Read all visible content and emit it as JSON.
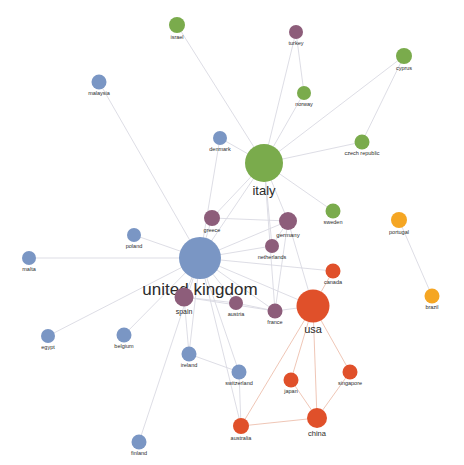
{
  "figure": {
    "type": "network-graph",
    "title": "",
    "watermark": "",
    "width": 464,
    "height": 465,
    "background": "#ffffff"
  },
  "palette": {
    "blue": "#7a96c4",
    "green": "#7aab4c",
    "purple": "#8d5d7a",
    "red": "#e0502a",
    "amber": "#f5a623",
    "edge": "#d9d9e2",
    "edge_warm": "#edbfae",
    "label": "#2b2b2b"
  },
  "clusters": [
    {
      "id": "blue",
      "color": "#7a96c4",
      "label": "blue-cluster"
    },
    {
      "id": "green",
      "color": "#7aab4c",
      "label": "green-cluster"
    },
    {
      "id": "purple",
      "color": "#8d5d7a",
      "label": "purple-cluster"
    },
    {
      "id": "red",
      "color": "#e0502a",
      "label": "red-cluster"
    },
    {
      "id": "amber",
      "color": "#f5a623",
      "label": "amber-cluster"
    }
  ],
  "chart_data": {
    "type": "network",
    "title": "",
    "xlabel": "",
    "ylabel": "",
    "nodes": [
      {
        "id": "israel",
        "label": "israel",
        "x": 177,
        "y": 25,
        "r": 8,
        "cluster": "green",
        "font": 5.5
      },
      {
        "id": "turkey",
        "label": "turkey",
        "x": 296,
        "y": 32,
        "r": 7,
        "cluster": "purple",
        "font": 5.5
      },
      {
        "id": "cyprus",
        "label": "cyprus",
        "x": 404,
        "y": 56,
        "r": 8,
        "cluster": "green",
        "font": 5.5
      },
      {
        "id": "malaysia",
        "label": "malaysia",
        "x": 99,
        "y": 82,
        "r": 7.5,
        "cluster": "blue",
        "font": 5.5
      },
      {
        "id": "norway",
        "label": "norway",
        "x": 304,
        "y": 93,
        "r": 7,
        "cluster": "green",
        "font": 5.5
      },
      {
        "id": "denmark",
        "label": "denmark",
        "x": 220,
        "y": 138,
        "r": 7,
        "cluster": "blue",
        "font": 5.5
      },
      {
        "id": "czech republic",
        "label": "czech republic",
        "x": 362,
        "y": 142,
        "r": 7.5,
        "cluster": "green",
        "font": 5.5
      },
      {
        "id": "italy",
        "label": "italy",
        "x": 264,
        "y": 163,
        "r": 19,
        "cluster": "green",
        "font": 13
      },
      {
        "id": "sweden",
        "label": "sweden",
        "x": 333,
        "y": 211,
        "r": 7.5,
        "cluster": "green",
        "font": 5.5
      },
      {
        "id": "greece",
        "label": "greece",
        "x": 212,
        "y": 218,
        "r": 8,
        "cluster": "purple",
        "font": 5.5
      },
      {
        "id": "portugal",
        "label": "portugal",
        "x": 399,
        "y": 220,
        "r": 8,
        "cluster": "amber",
        "font": 5.5
      },
      {
        "id": "germany",
        "label": "germany",
        "x": 288,
        "y": 221,
        "r": 9,
        "cluster": "purple",
        "font": 6
      },
      {
        "id": "poland",
        "label": "poland",
        "x": 134,
        "y": 235,
        "r": 7,
        "cluster": "blue",
        "font": 5.5
      },
      {
        "id": "netherlands",
        "label": "netherlands",
        "x": 272,
        "y": 246,
        "r": 7,
        "cluster": "purple",
        "font": 5.5
      },
      {
        "id": "malta",
        "label": "malta",
        "x": 29,
        "y": 258,
        "r": 7,
        "cluster": "blue",
        "font": 5.5
      },
      {
        "id": "united kingdom",
        "label": "united kingdom",
        "x": 200,
        "y": 258,
        "r": 21,
        "cluster": "blue",
        "font": 17
      },
      {
        "id": "canada",
        "label": "canada",
        "x": 333,
        "y": 271,
        "r": 7.5,
        "cluster": "red",
        "font": 5.5
      },
      {
        "id": "brazil",
        "label": "brazil",
        "x": 432,
        "y": 296,
        "r": 7.5,
        "cluster": "amber",
        "font": 5.5
      },
      {
        "id": "spain",
        "label": "spain",
        "x": 184,
        "y": 297,
        "r": 9.5,
        "cluster": "purple",
        "font": 7
      },
      {
        "id": "austria",
        "label": "austria",
        "x": 236,
        "y": 303,
        "r": 7,
        "cluster": "purple",
        "font": 5.5
      },
      {
        "id": "usa",
        "label": "usa",
        "x": 313,
        "y": 306,
        "r": 16.5,
        "cluster": "red",
        "font": 11
      },
      {
        "id": "france",
        "label": "france",
        "x": 275,
        "y": 311,
        "r": 7.5,
        "cluster": "purple",
        "font": 5.5
      },
      {
        "id": "egypt",
        "label": "egypt",
        "x": 48,
        "y": 336,
        "r": 7,
        "cluster": "blue",
        "font": 5.5
      },
      {
        "id": "belgium",
        "label": "belgium",
        "x": 124,
        "y": 335,
        "r": 7.5,
        "cluster": "blue",
        "font": 5.5
      },
      {
        "id": "ireland",
        "label": "ireland",
        "x": 189,
        "y": 354,
        "r": 7.5,
        "cluster": "blue",
        "font": 5.5
      },
      {
        "id": "singapore",
        "label": "singapore",
        "x": 350,
        "y": 372,
        "r": 7.5,
        "cluster": "red",
        "font": 5.5
      },
      {
        "id": "switzerland",
        "label": "switzerland",
        "x": 239,
        "y": 372,
        "r": 7.5,
        "cluster": "blue",
        "font": 5.5
      },
      {
        "id": "japan",
        "label": "japan",
        "x": 291,
        "y": 380,
        "r": 7.5,
        "cluster": "red",
        "font": 5.5
      },
      {
        "id": "china",
        "label": "china",
        "x": 317,
        "y": 418,
        "r": 10,
        "cluster": "red",
        "font": 7.5
      },
      {
        "id": "australia",
        "label": "australia",
        "x": 241,
        "y": 426,
        "r": 8,
        "cluster": "red",
        "font": 5.5
      },
      {
        "id": "finland",
        "label": "finland",
        "x": 139,
        "y": 442,
        "r": 7.5,
        "cluster": "blue",
        "font": 5.5
      }
    ],
    "edges": [
      {
        "source": "israel",
        "target": "italy",
        "tone": "cool"
      },
      {
        "source": "turkey",
        "target": "norway",
        "tone": "cool"
      },
      {
        "source": "turkey",
        "target": "italy",
        "tone": "cool"
      },
      {
        "source": "cyprus",
        "target": "italy",
        "tone": "cool"
      },
      {
        "source": "cyprus",
        "target": "czech republic",
        "tone": "cool"
      },
      {
        "source": "norway",
        "target": "italy",
        "tone": "cool"
      },
      {
        "source": "czech republic",
        "target": "italy",
        "tone": "cool"
      },
      {
        "source": "sweden",
        "target": "italy",
        "tone": "cool"
      },
      {
        "source": "italy",
        "target": "germany",
        "tone": "cool"
      },
      {
        "source": "italy",
        "target": "greece",
        "tone": "cool"
      },
      {
        "source": "italy",
        "target": "united kingdom",
        "tone": "cool"
      },
      {
        "source": "italy",
        "target": "netherlands",
        "tone": "cool"
      },
      {
        "source": "italy",
        "target": "denmark",
        "tone": "cool"
      },
      {
        "source": "italy",
        "target": "france",
        "tone": "cool"
      },
      {
        "source": "denmark",
        "target": "united kingdom",
        "tone": "cool"
      },
      {
        "source": "malaysia",
        "target": "united kingdom",
        "tone": "cool"
      },
      {
        "source": "greece",
        "target": "united kingdom",
        "tone": "cool"
      },
      {
        "source": "greece",
        "target": "germany",
        "tone": "cool"
      },
      {
        "source": "poland",
        "target": "united kingdom",
        "tone": "cool"
      },
      {
        "source": "malta",
        "target": "united kingdom",
        "tone": "cool"
      },
      {
        "source": "germany",
        "target": "united kingdom",
        "tone": "cool"
      },
      {
        "source": "germany",
        "target": "netherlands",
        "tone": "cool"
      },
      {
        "source": "germany",
        "target": "france",
        "tone": "cool"
      },
      {
        "source": "germany",
        "target": "usa",
        "tone": "cool"
      },
      {
        "source": "netherlands",
        "target": "united kingdom",
        "tone": "cool"
      },
      {
        "source": "united kingdom",
        "target": "spain",
        "tone": "cool"
      },
      {
        "source": "united kingdom",
        "target": "austria",
        "tone": "cool"
      },
      {
        "source": "united kingdom",
        "target": "france",
        "tone": "cool"
      },
      {
        "source": "united kingdom",
        "target": "egypt",
        "tone": "cool"
      },
      {
        "source": "united kingdom",
        "target": "belgium",
        "tone": "cool"
      },
      {
        "source": "united kingdom",
        "target": "ireland",
        "tone": "cool"
      },
      {
        "source": "united kingdom",
        "target": "switzerland",
        "tone": "cool"
      },
      {
        "source": "united kingdom",
        "target": "finland",
        "tone": "cool"
      },
      {
        "source": "united kingdom",
        "target": "usa",
        "tone": "cool"
      },
      {
        "source": "united kingdom",
        "target": "australia",
        "tone": "cool"
      },
      {
        "source": "united kingdom",
        "target": "canada",
        "tone": "cool"
      },
      {
        "source": "spain",
        "target": "austria",
        "tone": "cool"
      },
      {
        "source": "spain",
        "target": "france",
        "tone": "cool"
      },
      {
        "source": "spain",
        "target": "ireland",
        "tone": "cool"
      },
      {
        "source": "austria",
        "target": "france",
        "tone": "cool"
      },
      {
        "source": "france",
        "target": "usa",
        "tone": "cool"
      },
      {
        "source": "ireland",
        "target": "switzerland",
        "tone": "cool"
      },
      {
        "source": "switzerland",
        "target": "australia",
        "tone": "cool"
      },
      {
        "source": "usa",
        "target": "canada",
        "tone": "warm"
      },
      {
        "source": "usa",
        "target": "japan",
        "tone": "warm"
      },
      {
        "source": "usa",
        "target": "singapore",
        "tone": "warm"
      },
      {
        "source": "usa",
        "target": "china",
        "tone": "warm"
      },
      {
        "source": "usa",
        "target": "australia",
        "tone": "warm"
      },
      {
        "source": "china",
        "target": "australia",
        "tone": "warm"
      },
      {
        "source": "china",
        "target": "japan",
        "tone": "warm"
      },
      {
        "source": "china",
        "target": "singapore",
        "tone": "warm"
      },
      {
        "source": "portugal",
        "target": "brazil",
        "tone": "cool"
      }
    ],
    "legend": {
      "visible": false,
      "position": "none"
    },
    "grid": false
  }
}
